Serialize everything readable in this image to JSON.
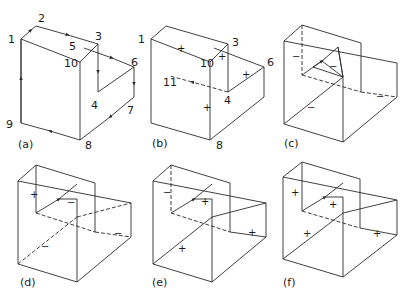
{
  "figure": {
    "panels": [
      {
        "id": "a",
        "caption": "(a)",
        "vertex_labels": [
          "1",
          "2",
          "3",
          "4",
          "5",
          "6",
          "7",
          "8",
          "9",
          "10"
        ]
      },
      {
        "id": "b",
        "caption": "(b)",
        "vertex_labels": [
          "1",
          "3",
          "10",
          "6",
          "11",
          "4",
          "8"
        ],
        "signs": [
          "+",
          "+",
          "+",
          "+"
        ]
      },
      {
        "id": "c",
        "caption": "(c)",
        "signs": [
          "−",
          "−",
          "−",
          "−"
        ]
      },
      {
        "id": "d",
        "caption": "(d)",
        "signs": [
          "+",
          "−",
          "−",
          "−"
        ]
      },
      {
        "id": "e",
        "caption": "(e)",
        "signs": [
          "−",
          "+",
          "+",
          "+"
        ]
      },
      {
        "id": "f",
        "caption": "(f)",
        "signs": [
          "+",
          "+",
          "+",
          "+"
        ]
      }
    ]
  },
  "colors": {
    "line": "#2b2b2b",
    "background": "#ffffff"
  }
}
